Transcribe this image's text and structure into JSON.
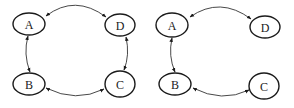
{
  "diagrams": [
    {
      "id": "left",
      "nodes": [
        {
          "label": "A",
          "cx": 29,
          "cy": 24,
          "rx": 16,
          "ry": 11
        },
        {
          "label": "D",
          "cx": 120,
          "cy": 25,
          "rx": 15,
          "ry": 11
        },
        {
          "label": "B",
          "cx": 29,
          "cy": 84,
          "rx": 16,
          "ry": 11
        },
        {
          "label": "C",
          "cx": 120,
          "cy": 84,
          "rx": 15,
          "ry": 13
        }
      ],
      "edges": [
        {
          "from": "A",
          "to": "D",
          "directed": "both"
        },
        {
          "from": "A",
          "to": "B",
          "directed": "both"
        },
        {
          "from": "B",
          "to": "C",
          "directed": "both"
        },
        {
          "from": "D",
          "to": "C",
          "directed": "both"
        }
      ]
    },
    {
      "id": "right",
      "nodes": [
        {
          "label": "A",
          "cx": 172,
          "cy": 25,
          "rx": 16,
          "ry": 12
        },
        {
          "label": "D",
          "cx": 265,
          "cy": 27,
          "rx": 15,
          "ry": 11
        },
        {
          "label": "B",
          "cx": 175,
          "cy": 84,
          "rx": 16,
          "ry": 11
        },
        {
          "label": "C",
          "cx": 264,
          "cy": 86,
          "rx": 15,
          "ry": 13
        }
      ],
      "edges": [
        {
          "from": "A",
          "to": "D",
          "directed": "both"
        },
        {
          "from": "A",
          "to": "B",
          "directed": "both"
        },
        {
          "from": "B",
          "to": "C",
          "directed": "both"
        }
      ]
    }
  ]
}
